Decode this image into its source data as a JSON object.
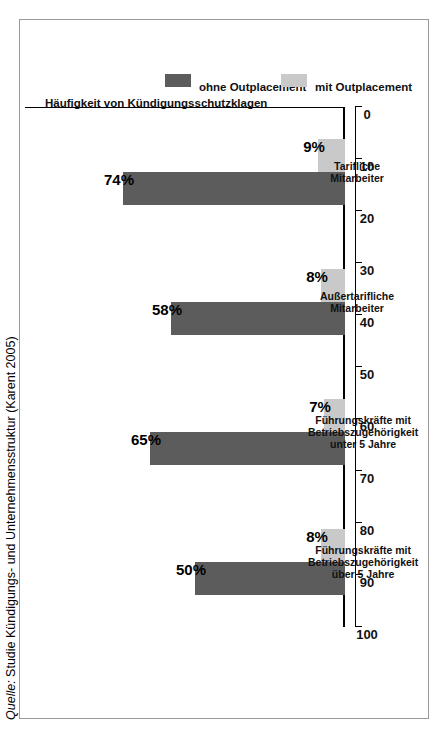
{
  "chart_data": {
    "type": "bar",
    "orientation": "horizontal-rotated",
    "title": "",
    "xlabel": "",
    "ylabel": "Häufigkeit von Kündigungsschutzklagen",
    "ylim": [
      0,
      100
    ],
    "ticks": [
      0,
      10,
      20,
      30,
      40,
      50,
      60,
      70,
      80,
      90,
      100
    ],
    "tick_labels": [
      "0",
      "10",
      "20",
      "30",
      "40",
      "50",
      "60",
      "70",
      "80",
      "90",
      "100"
    ],
    "grid": false,
    "legend_position": "right",
    "categories": [
      "Führungskräfte mit\nBetriebszugehörigkeit\nüber 5 Jahre",
      "Führungskräfte mit\nBetriebszugehörigkeit\nunter 5 Jahre",
      "Außertarifliche\nMitarbeiter",
      "Tarifliche\nMitarbeiter"
    ],
    "series": [
      {
        "name": "ohne Outplacement",
        "color": "#5c5c5c",
        "values": [
          50,
          65,
          58,
          74
        ],
        "value_labels": [
          "50%",
          "65%",
          "58%",
          "74%"
        ]
      },
      {
        "name": "mit Outplacement",
        "color": "#c9c9c9",
        "values": [
          8,
          7,
          8,
          9
        ],
        "value_labels": [
          "8%",
          "7%",
          "8%",
          "9%"
        ]
      }
    ]
  },
  "axis": {
    "value_axis_title": "Häufigkeit von Kündigungsschutzklagen"
  },
  "legend": {
    "items": [
      {
        "label": "ohne Outplacement",
        "color": "#5c5c5c"
      },
      {
        "label": "mit Outplacement",
        "color": "#c9c9c9"
      }
    ]
  },
  "source": {
    "prefix": "Quelle:",
    "text": " Studie Kündigungs- und Unternehmensstruktur (Karent 2005)"
  }
}
